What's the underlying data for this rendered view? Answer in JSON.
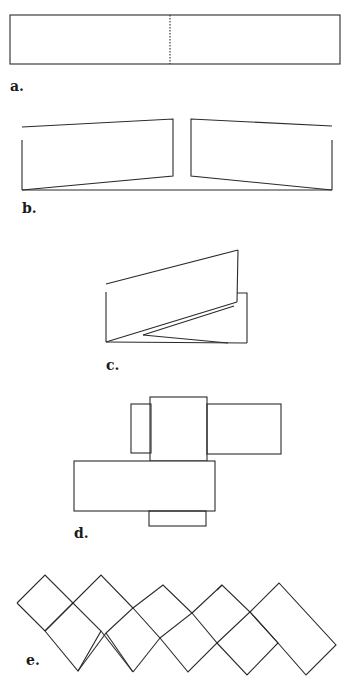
{
  "figures": [
    {
      "id": "a",
      "label": "a.",
      "description": "flat strip with dotted center fold line"
    },
    {
      "id": "b",
      "label": "b.",
      "description": "strip folded up on both halves"
    },
    {
      "id": "c",
      "label": "c.",
      "description": "strip folded into a zig-zag"
    },
    {
      "id": "d",
      "label": "d.",
      "description": "interlocked rectangles forming a cross"
    },
    {
      "id": "e",
      "label": "e.",
      "description": "lattice of squares rotated 45 degrees"
    }
  ],
  "colors": {
    "stroke": "#2a2a2a",
    "background": "#ffffff"
  }
}
